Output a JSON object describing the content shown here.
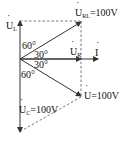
{
  "diagram": {
    "type": "phasor-diagram",
    "phasors": [
      {
        "name": "U_L",
        "symbol": "U",
        "subscript": "L",
        "value": ""
      },
      {
        "name": "U_RL",
        "symbol": "U",
        "subscript": "RL",
        "value": "=100V"
      },
      {
        "name": "U_R",
        "symbol": "U",
        "subscript": "R",
        "value": ""
      },
      {
        "name": "I",
        "symbol": "I",
        "subscript": "",
        "value": ""
      },
      {
        "name": "U",
        "symbol": "U",
        "subscript": "",
        "value": "=100V"
      },
      {
        "name": "U_C",
        "symbol": "U",
        "subscript": "C",
        "value": "=100V"
      }
    ],
    "angles": [
      "60°",
      "30°",
      "30°",
      "60°"
    ],
    "colors": {
      "line": "#333333",
      "text": "#111111"
    }
  }
}
